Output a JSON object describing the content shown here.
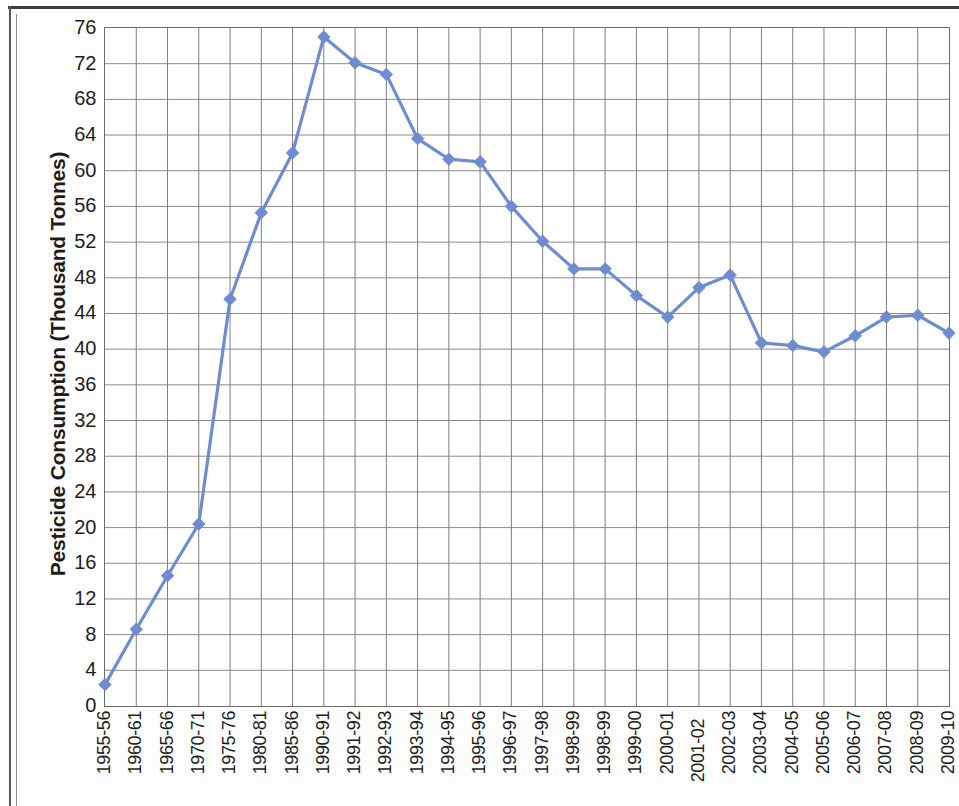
{
  "chart_data": {
    "type": "line",
    "title": "",
    "xlabel": "",
    "ylabel": "Pesticide Consumption (Thousand Tonnes)",
    "ylim": [
      0,
      76
    ],
    "ytick_step": 4,
    "grid": true,
    "legend": "none",
    "series_color": "#6e8ccf",
    "marker": "diamond",
    "categories": [
      "1955-56",
      "1960-61",
      "1965-66",
      "1970-71",
      "1975-76",
      "1980-81",
      "1985-86",
      "1990-91",
      "1991-92",
      "1992-93",
      "1993-94",
      "1994-95",
      "1995-96",
      "1996-97",
      "1997-98",
      "1998-99",
      "1998-99",
      "1999-00",
      "2000-01",
      "2001-02",
      "2002-03",
      "2003-04",
      "2004-05",
      "2005-06",
      "2006-07",
      "2007-08",
      "2008-09",
      "2009-10"
    ],
    "values": [
      2.4,
      8.6,
      14.6,
      20.4,
      45.6,
      55.3,
      62.0,
      75.0,
      72.1,
      70.8,
      63.6,
      61.3,
      61.0,
      56.0,
      52.1,
      49.0,
      49.0,
      46.0,
      43.6,
      46.9,
      48.3,
      40.7,
      40.4,
      39.7,
      41.5,
      43.6,
      43.8,
      41.8
    ],
    "ytick_labels": [
      "76",
      "72",
      "68",
      "64",
      "60",
      "56",
      "52",
      "48",
      "44",
      "40",
      "36",
      "32",
      "28",
      "24",
      "20",
      "16",
      "12",
      "8",
      "4",
      "0"
    ]
  }
}
